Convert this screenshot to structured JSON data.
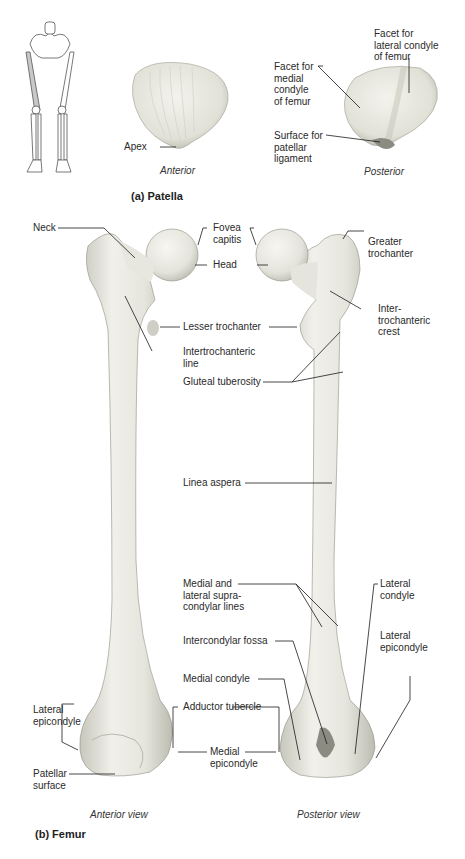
{
  "patella": {
    "title": "(a) Patella",
    "anterior_caption": "Anterior",
    "posterior_caption": "Posterior",
    "labels": {
      "apex": "Apex",
      "facet_lateral": "Facet for\nlateral condyle\nof femur",
      "facet_medial": "Facet for\nmedial\ncondyle\nof femur",
      "surface_ligament": "Surface for\npatellar\nligament"
    }
  },
  "femur": {
    "title": "(b) Femur",
    "anterior_caption": "Anterior view",
    "posterior_caption": "Posterior view",
    "labels": {
      "neck": "Neck",
      "fovea_capitis": "Fovea\ncapitis",
      "head": "Head",
      "greater_trochanter": "Greater\ntrochanter",
      "intertrochanteric_crest": "Inter-\ntrochanteric\ncrest",
      "lesser_trochanter": "Lesser trochanter",
      "intertrochanteric_line": "Intertrochanteric\nline",
      "gluteal_tuberosity": "Gluteal tuberosity",
      "linea_aspera": "Linea aspera",
      "supracondylar_lines": "Medial and\nlateral supra-\ncondylar lines",
      "lateral_condyle": "Lateral\ncondyle",
      "intercondylar_fossa": "Intercondylar fossa",
      "lateral_epicondyle_post": "Lateral\nepicondyle",
      "medial_condyle": "Medial condyle",
      "lateral_epicondyle_ant": "Lateral\nepicondyle",
      "adductor_tubercle": "Adductor tubercle",
      "medial_epicondyle": "Medial\nepicondyle",
      "patellar_surface": "Patellar\nsurface"
    }
  },
  "colors": {
    "bone": "#ecebe3",
    "bone_shade": "#c9c8bd",
    "leader_line": "#1a1a1a",
    "highlight_femur": "#c8c8c8"
  }
}
